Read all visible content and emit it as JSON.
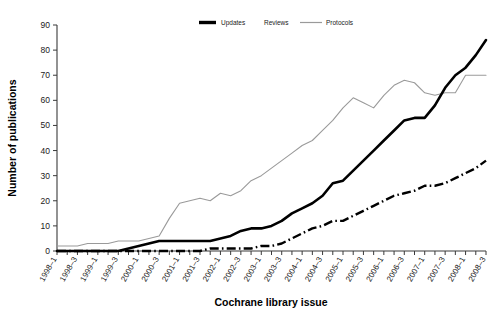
{
  "chart_data": {
    "type": "line",
    "title": "",
    "xlabel": "Cochrane library issue",
    "ylabel": "Number of publications",
    "ylim": [
      0,
      90
    ],
    "yticks": [
      0,
      10,
      20,
      30,
      40,
      50,
      60,
      70,
      80,
      90
    ],
    "grid": false,
    "legend_position": "top-center",
    "categories": [
      "1998-1",
      "1998-2",
      "1998-3",
      "1998-4",
      "1999-1",
      "1999-2",
      "1999-3",
      "1999-4",
      "2000-1",
      "2000-2",
      "2000-3",
      "2000-4",
      "2001-1",
      "2001-2",
      "2001-3",
      "2001-4",
      "2002-1",
      "2002-2",
      "2002-3",
      "2002-4",
      "2003-1",
      "2003-2",
      "2003-3",
      "2003-4",
      "2004-1",
      "2004-2",
      "2004-3",
      "2004-4",
      "2005-1",
      "2005-2",
      "2005-3",
      "2005-4",
      "2006-1",
      "2006-2",
      "2006-3",
      "2006-4",
      "2007-1",
      "2007-2",
      "2007-3",
      "2007-4",
      "2008-1",
      "2008-2",
      "2008-3"
    ],
    "xtick_labels": [
      "1998–1",
      "1998–3",
      "1999–1",
      "1999–3",
      "2000–1",
      "2000–3",
      "2001–1",
      "2001–3",
      "2002–1",
      "2002–3",
      "2003–1",
      "2003–3",
      "2004–1",
      "2004–3",
      "2005–1",
      "2005–3",
      "2006–1",
      "2006–3",
      "2007–1",
      "2007–3",
      "2008–1",
      "2008–3"
    ],
    "series": [
      {
        "name": "Updates",
        "style": "thick-solid-black",
        "color": "#000000",
        "values": [
          0,
          0,
          0,
          0,
          0,
          0,
          0,
          1,
          2,
          3,
          4,
          4,
          4,
          4,
          4,
          4,
          5,
          6,
          8,
          9,
          9,
          10,
          12,
          15,
          17,
          19,
          22,
          27,
          28,
          32,
          36,
          40,
          44,
          48,
          52,
          53,
          53,
          58,
          65,
          70,
          73,
          78,
          84
        ]
      },
      {
        "name": "Reviews",
        "style": "thin-solid-gray",
        "color": "#9a9a9a",
        "values": [
          2,
          2,
          2,
          3,
          3,
          3,
          4,
          4,
          4,
          5,
          6,
          13,
          19,
          20,
          21,
          20,
          23,
          22,
          24,
          28,
          30,
          33,
          36,
          39,
          42,
          44,
          48,
          52,
          57,
          61,
          59,
          57,
          62,
          66,
          68,
          67,
          63,
          62,
          63,
          63,
          70,
          70,
          70
        ]
      },
      {
        "name": "Protocols",
        "style": "thick-dash-dot-black",
        "color": "#000000",
        "values": [
          0,
          0,
          0,
          0,
          0,
          0,
          0,
          0,
          0,
          0,
          0,
          0,
          0,
          0,
          0,
          1,
          1,
          1,
          1,
          1,
          2,
          2,
          3,
          5,
          7,
          9,
          10,
          12,
          12,
          14,
          16,
          18,
          20,
          22,
          23,
          24,
          26,
          26,
          27,
          29,
          31,
          33,
          36
        ]
      }
    ]
  },
  "legend": {
    "items": [
      {
        "label": "Updates"
      },
      {
        "label": "Reviews"
      },
      {
        "label": "Protocols"
      }
    ]
  }
}
